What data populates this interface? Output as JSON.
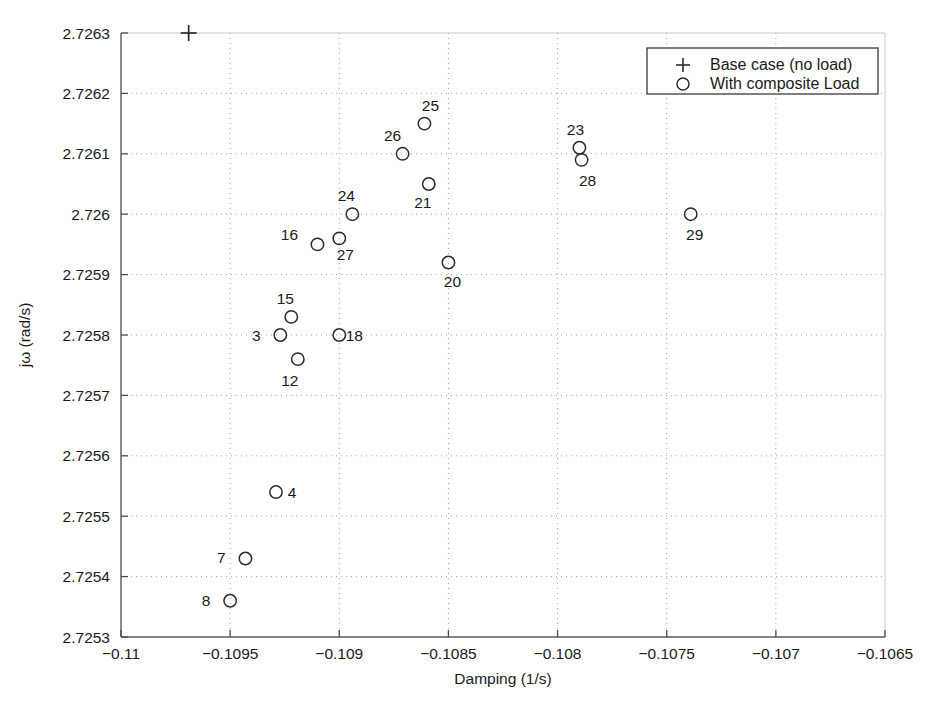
{
  "chart_data": {
    "type": "scatter",
    "title": "",
    "xlabel": "Damping (1/s)",
    "ylabel": "jω (rad/s)",
    "xlim": [
      -0.11,
      -0.1065
    ],
    "ylim": [
      2.7253,
      2.7263
    ],
    "grid": true,
    "grid_style": "dotted",
    "xticks": [
      -0.11,
      -0.1095,
      -0.109,
      -0.1085,
      -0.108,
      -0.1075,
      -0.107,
      -0.1065
    ],
    "xtick_labels": [
      "-0.11",
      "-0.1095",
      "-0.109",
      "-0.1085",
      "-0.108",
      "-0.1075",
      "-0.107",
      "-0.1065"
    ],
    "yticks": [
      2.7253,
      2.7254,
      2.7255,
      2.7256,
      2.7257,
      2.7258,
      2.7259,
      2.726,
      2.7261,
      2.7262,
      2.7263
    ],
    "ytick_labels": [
      "2.7253",
      "2.7254",
      "2.7255",
      "2.7256",
      "2.7257",
      "2.7258",
      "2.7259",
      "2.726",
      "2.7261",
      "2.7262",
      "2.7263"
    ],
    "legend_position": "top-right",
    "series": [
      {
        "name": "Base case (no load)",
        "marker": "plus",
        "points": [
          {
            "label": "",
            "x": -0.10969,
            "y": 2.7263
          }
        ]
      },
      {
        "name": "With composite Load",
        "marker": "circle",
        "points": [
          {
            "label": "8",
            "x": -0.1095,
            "y": 2.72536,
            "label_dx": -24,
            "label_dy": 5
          },
          {
            "label": "7",
            "x": -0.10943,
            "y": 2.72543,
            "label_dx": -24,
            "label_dy": 5
          },
          {
            "label": "4",
            "x": -0.10929,
            "y": 2.72554,
            "label_dx": 16,
            "label_dy": 6
          },
          {
            "label": "3",
            "x": -0.10927,
            "y": 2.7258,
            "label_dx": -24,
            "label_dy": 6
          },
          {
            "label": "15",
            "x": -0.10922,
            "y": 2.72583,
            "label_dx": -6,
            "label_dy": -13
          },
          {
            "label": "12",
            "x": -0.10919,
            "y": 2.72576,
            "label_dx": -8,
            "label_dy": 27
          },
          {
            "label": "18",
            "x": -0.109,
            "y": 2.7258,
            "label_dx": 15,
            "label_dy": 6
          },
          {
            "label": "16",
            "x": -0.1091,
            "y": 2.72595,
            "label_dx": -28,
            "label_dy": -4
          },
          {
            "label": "27",
            "x": -0.109,
            "y": 2.72596,
            "label_dx": 6,
            "label_dy": 22
          },
          {
            "label": "24",
            "x": -0.10894,
            "y": 2.726,
            "label_dx": -6,
            "label_dy": -13
          },
          {
            "label": "26",
            "x": -0.10871,
            "y": 2.7261,
            "label_dx": -10,
            "label_dy": -13
          },
          {
            "label": "25",
            "x": -0.10861,
            "y": 2.72615,
            "label_dx": 6,
            "label_dy": -13
          },
          {
            "label": "21",
            "x": -0.10859,
            "y": 2.72605,
            "label_dx": -6,
            "label_dy": 24
          },
          {
            "label": "20",
            "x": -0.1085,
            "y": 2.72592,
            "label_dx": 4,
            "label_dy": 24
          },
          {
            "label": "23",
            "x": -0.1079,
            "y": 2.72611,
            "label_dx": -4,
            "label_dy": -13
          },
          {
            "label": "28",
            "x": -0.10789,
            "y": 2.72609,
            "label_dx": 6,
            "label_dy": 26
          },
          {
            "label": "29",
            "x": -0.10739,
            "y": 2.726,
            "label_dx": 4,
            "label_dy": 26
          }
        ]
      }
    ]
  },
  "legend": {
    "entries": [
      {
        "marker": "+",
        "label": "Base case (no load)"
      },
      {
        "marker": "○",
        "label": "With composite Load"
      }
    ]
  },
  "axes": {
    "xlabel": "Damping (1/s)",
    "ylabel": "jω (rad/s)"
  },
  "colors": {
    "axis": "#4d4d4d",
    "grid": "#9a9a9a",
    "marker": "#2b2b2b",
    "text": "#1a1a1a",
    "background": "#ffffff"
  }
}
